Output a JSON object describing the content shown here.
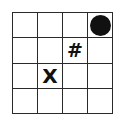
{
  "board": {
    "rows": 4,
    "cols": 4,
    "cells": [
      [
        "",
        "",
        "",
        "circle"
      ],
      [
        "",
        "",
        "#",
        ""
      ],
      [
        "",
        "X",
        "",
        ""
      ],
      [
        "",
        "",
        "",
        ""
      ]
    ]
  },
  "pieces": {
    "circle": {
      "row": 0,
      "col": 3,
      "shape": "filled-circle",
      "color": "#111111"
    },
    "hash": {
      "row": 1,
      "col": 2,
      "symbol": "#"
    },
    "x": {
      "row": 2,
      "col": 1,
      "symbol": "X"
    }
  }
}
